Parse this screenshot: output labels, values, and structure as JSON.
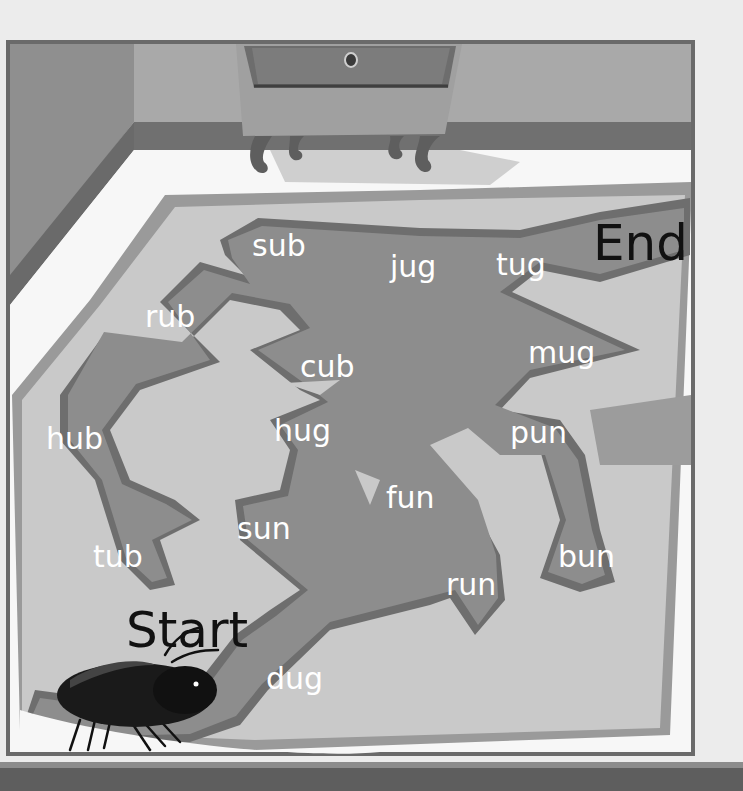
{
  "maze": {
    "start_label": "Start",
    "end_label": "End",
    "words": [
      {
        "text": "sub",
        "x": 252,
        "y": 231
      },
      {
        "text": "jug",
        "x": 390,
        "y": 252
      },
      {
        "text": "tug",
        "x": 496,
        "y": 250
      },
      {
        "text": "rub",
        "x": 145,
        "y": 302
      },
      {
        "text": "cub",
        "x": 300,
        "y": 352
      },
      {
        "text": "mug",
        "x": 528,
        "y": 338
      },
      {
        "text": "hub",
        "x": 46,
        "y": 424
      },
      {
        "text": "hug",
        "x": 274,
        "y": 416
      },
      {
        "text": "pun",
        "x": 510,
        "y": 418
      },
      {
        "text": "fun",
        "x": 386,
        "y": 483
      },
      {
        "text": "sun",
        "x": 237,
        "y": 514
      },
      {
        "text": "tub",
        "x": 93,
        "y": 542
      },
      {
        "text": "bun",
        "x": 558,
        "y": 542
      },
      {
        "text": "run",
        "x": 446,
        "y": 570
      },
      {
        "text": "dug",
        "x": 266,
        "y": 664
      }
    ]
  },
  "colors": {
    "background": "#ececec",
    "frame_border": "#6a6a6a",
    "wall_left": "#8a8a8a",
    "wall_back": "#a9a9a9",
    "baseboard": "#6f6f6f",
    "floor": "#f7f7f7",
    "paper": "#c9c9c9",
    "paper_border": "#9a9a9a",
    "path": "#8d8d8d",
    "path_border": "#6e6e6e",
    "word_text": "#ffffff",
    "label_text": "#111111"
  },
  "icons": {
    "beetle": "beetle-icon",
    "dresser": "dresser-icon"
  }
}
